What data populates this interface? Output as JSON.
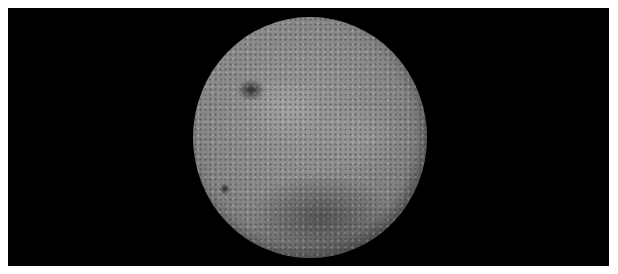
{
  "image": {
    "subject": "Far side of the Moon",
    "background_color": "#000000",
    "border_color": "#ffffff",
    "moon_base_color": "#8c8c8c",
    "features": [
      {
        "name": "dark-mare-upper-left",
        "approx_position": [
          253,
          82
        ]
      },
      {
        "name": "small-dark-crater-left",
        "approx_position": [
          225,
          180
        ]
      },
      {
        "name": "dark-basin-lower-center",
        "approx_position": [
          320,
          210
        ]
      }
    ]
  }
}
